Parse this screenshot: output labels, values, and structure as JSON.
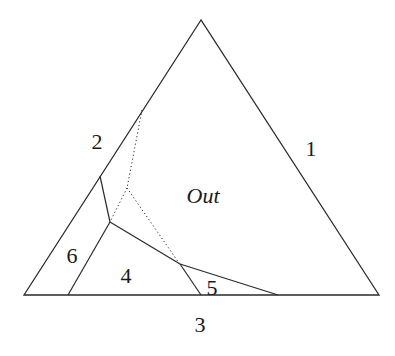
{
  "diagram": {
    "type": "ternary-region-diagram",
    "stroke_color": "#2a2a2a",
    "background": "#ffffff",
    "triangle": {
      "apex": [
        201,
        20
      ],
      "bottom_left": [
        24,
        295
      ],
      "bottom_right": [
        379,
        295
      ]
    },
    "solid_lines": [
      {
        "name": "boundary-2-6",
        "points": [
          [
            100,
            176
          ],
          [
            110,
            222
          ]
        ]
      },
      {
        "name": "boundary-6-4",
        "points": [
          [
            110,
            222
          ],
          [
            68,
            295
          ]
        ]
      },
      {
        "name": "boundary-4-out",
        "points": [
          [
            110,
            222
          ],
          [
            180,
            264
          ]
        ]
      },
      {
        "name": "boundary-4-5",
        "points": [
          [
            180,
            264
          ],
          [
            201,
            295
          ]
        ]
      },
      {
        "name": "boundary-5-out",
        "points": [
          [
            180,
            264
          ],
          [
            278,
            295
          ]
        ]
      }
    ],
    "dotted_lines": [
      {
        "name": "dotted-upper",
        "points": [
          [
            142,
            110
          ],
          [
            127,
            188
          ]
        ]
      },
      {
        "name": "dotted-lower-left",
        "points": [
          [
            127,
            188
          ],
          [
            111,
            220
          ]
        ]
      },
      {
        "name": "dotted-lower-right",
        "points": [
          [
            127,
            188
          ],
          [
            179,
            263
          ]
        ]
      }
    ],
    "labels": [
      {
        "id": "region-1",
        "text": "1",
        "x": 311,
        "y": 156,
        "italic": false
      },
      {
        "id": "region-2",
        "text": "2",
        "x": 97,
        "y": 149,
        "italic": false
      },
      {
        "id": "region-3",
        "text": "3",
        "x": 200,
        "y": 332,
        "italic": false
      },
      {
        "id": "region-4",
        "text": "4",
        "x": 126,
        "y": 283,
        "italic": false
      },
      {
        "id": "region-5",
        "text": "5",
        "x": 212,
        "y": 295,
        "italic": false
      },
      {
        "id": "region-6",
        "text": "6",
        "x": 72,
        "y": 263,
        "italic": false
      },
      {
        "id": "region-out",
        "text": "Out",
        "x": 203,
        "y": 203,
        "italic": true
      }
    ]
  }
}
